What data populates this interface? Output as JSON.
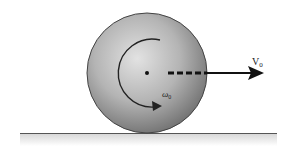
{
  "diagram": {
    "type": "physics-rolling-ball",
    "labels": {
      "velocity": "V",
      "velocity_subscript": "0",
      "angular_velocity": "ω",
      "angular_velocity_subscript": "0"
    },
    "colors": {
      "ball_light": "#e0e0e0",
      "ball_mid": "#a8a8a8",
      "ball_dark": "#6e6e6e",
      "outline": "#444444",
      "arrow": "#111111",
      "ground": "#555555"
    },
    "geometry": {
      "ball_center": [
        147,
        73
      ],
      "ball_radius": 60,
      "ground_y": 133,
      "ground_x": [
        20,
        277
      ],
      "velocity_arrow_from": [
        168,
        73
      ],
      "velocity_arrow_to": [
        264,
        73
      ]
    }
  }
}
